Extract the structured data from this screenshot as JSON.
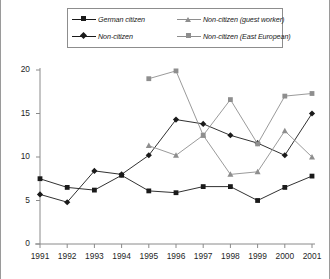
{
  "chart_data": {
    "type": "line",
    "title": "",
    "subtitle": "",
    "xlabel": "",
    "ylabel": "",
    "x": [
      1991,
      1992,
      1993,
      1994,
      1995,
      1996,
      1997,
      1998,
      1999,
      2000,
      2001
    ],
    "categories": [
      "1991",
      "1992",
      "1993",
      "1994",
      "1995",
      "1996",
      "1997",
      "1998",
      "1999",
      "2000",
      "2001"
    ],
    "xlim": [
      1991,
      2001
    ],
    "ylim": [
      0,
      20
    ],
    "yticks": [
      0,
      5,
      10,
      15,
      20
    ],
    "ytick_labels": [
      "0",
      "5",
      "10",
      "15",
      "20"
    ],
    "xticks": [
      1991,
      1992,
      1993,
      1994,
      1995,
      1996,
      1997,
      1998,
      1999,
      2000,
      2001
    ],
    "grid": false,
    "legend_position": "top",
    "series": [
      {
        "name": "German citizen",
        "marker": "square",
        "color": "#1a1a1a",
        "values": [
          7.5,
          6.5,
          6.2,
          7.9,
          6.1,
          5.9,
          6.6,
          6.6,
          5.0,
          6.5,
          7.8
        ]
      },
      {
        "name": "Non-citizen",
        "marker": "diamond",
        "color": "#1a1a1a",
        "values": [
          5.7,
          4.8,
          8.4,
          8.0,
          10.2,
          14.3,
          13.8,
          12.5,
          11.6,
          10.2,
          15.0
        ]
      },
      {
        "name": "Non-citizen (guest worker)",
        "marker": "triangle",
        "color": "#8e8e8e",
        "values": [
          null,
          null,
          null,
          null,
          11.3,
          10.2,
          12.5,
          8.0,
          8.3,
          13.0,
          10.0
        ]
      },
      {
        "name": "Non-citizen (East European)",
        "marker": "square",
        "color": "#8e8e8e",
        "values": [
          null,
          null,
          null,
          null,
          19.0,
          19.9,
          12.5,
          16.6,
          11.5,
          17.0,
          17.3
        ]
      }
    ]
  },
  "legend": {
    "items": [
      {
        "label": "German citizen"
      },
      {
        "label": "Non-citizen (guest worker)"
      },
      {
        "label": "Non-citizen"
      },
      {
        "label": "Non-citizen (East European)"
      }
    ]
  },
  "colors": {
    "series_dark": "#1a1a1a",
    "series_gray": "#8e8e8e",
    "axis": "#8a8a8a",
    "frame": "#9a9a9a",
    "background": "#ffffff"
  }
}
